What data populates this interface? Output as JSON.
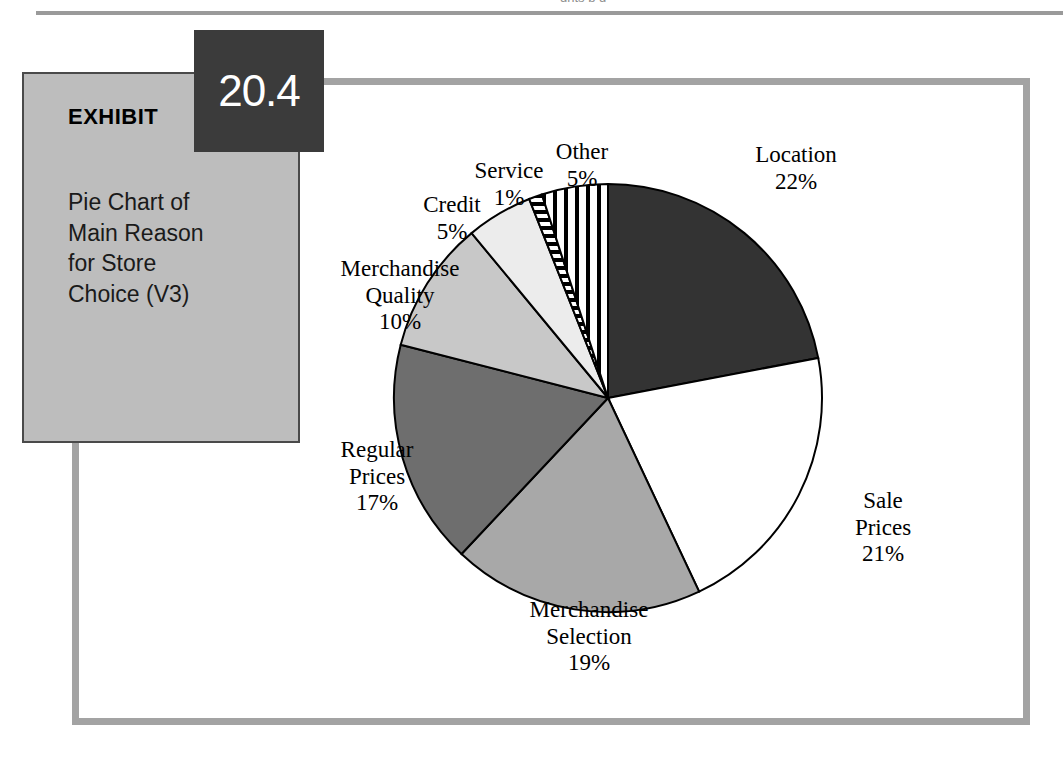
{
  "page": {
    "running_head_fragment": "ghts   p    g"
  },
  "exhibit": {
    "label": "EXHIBIT",
    "number": "20.4",
    "title": "Pie Chart of\nMain Reason\nfor Store\nChoice (V3)"
  },
  "chart_data": {
    "type": "pie",
    "title": "Pie Chart of Main Reason for Store Choice (V3)",
    "value_unit": "%",
    "start_angle_deg": 0,
    "direction": "clockwise",
    "legend": "none-labels-outside",
    "categories": [
      "Location",
      "Sale Prices",
      "Merchandise Selection",
      "Regular Prices",
      "Merchandise Quality",
      "Credit",
      "Service",
      "Other"
    ],
    "values": [
      22,
      21,
      19,
      17,
      10,
      5,
      1,
      5
    ],
    "slices": [
      {
        "name": "Location",
        "value": 22,
        "label": "Location\n22%",
        "fill": "#333333",
        "pattern": "solid"
      },
      {
        "name": "Sale Prices",
        "value": 21,
        "label": "Sale\nPrices\n21%",
        "fill": "#ffffff",
        "pattern": "solid"
      },
      {
        "name": "Merchandise Selection",
        "value": 19,
        "label": "Merchandise\nSelection\n19%",
        "fill": "#a8a8a8",
        "pattern": "solid"
      },
      {
        "name": "Regular Prices",
        "value": 17,
        "label": "Regular\nPrices\n17%",
        "fill": "#6e6e6e",
        "pattern": "solid"
      },
      {
        "name": "Merchandise Quality",
        "value": 10,
        "label": "Merchandise\nQuality\n10%",
        "fill": "#c8c8c8",
        "pattern": "solid"
      },
      {
        "name": "Credit",
        "value": 5,
        "label": "Credit\n5%",
        "fill": "#ececec",
        "pattern": "solid"
      },
      {
        "name": "Service",
        "value": 1,
        "label": "Service\n1%",
        "fill": "#ffffff",
        "pattern": "horizontal-stripes"
      },
      {
        "name": "Other",
        "value": 5,
        "label": "Other\n5%",
        "fill": "#ffffff",
        "pattern": "vertical-stripes"
      }
    ]
  },
  "colors": {
    "frame": "#a3a3a3",
    "caption_panel": "#bdbdbd",
    "badge": "#3b3b3b",
    "outline": "#000000"
  }
}
